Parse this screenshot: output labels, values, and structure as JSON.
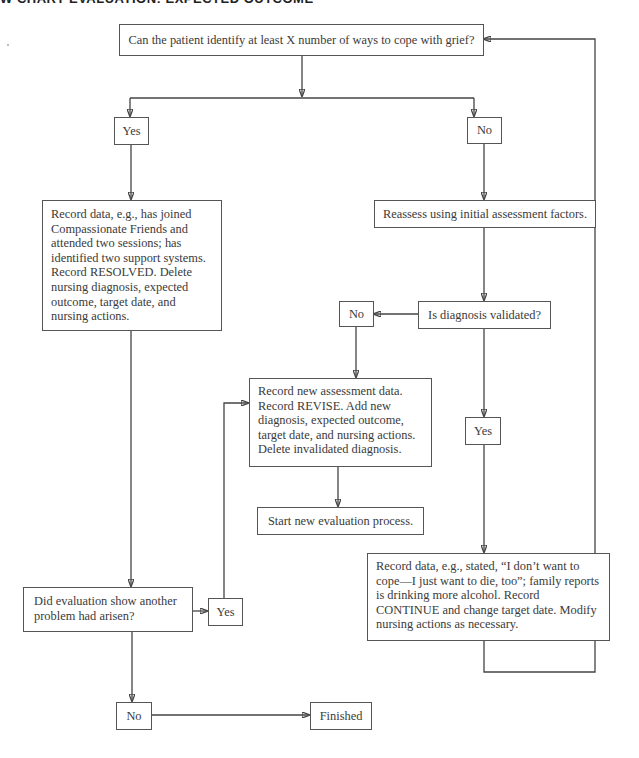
{
  "header": {
    "title": "W CHART EVALUATION: EXPECTED OUTCOME"
  },
  "nodes": {
    "start_question": "Can the patient identify at least X number of ways to cope with grief?",
    "yes_top": "Yes",
    "no_top": "No",
    "resolved_record": "Record data, e.g., has joined Compassionate Friends and attended two sessions; has identified two support systems. Record RESOLVED. Delete nursing diagnosis, expected outcome, target date, and nursing actions.",
    "reassess": "Reassess using initial assessment factors.",
    "diagnosis_validated": "Is diagnosis validated?",
    "no_validated": "No",
    "revise_record": "Record new assessment data. Record REVISE. Add new diagnosis, expected outcome, target date, and nursing actions. Delete invalidated diagnosis.",
    "start_new": "Start new evaluation process.",
    "yes_validated": "Yes",
    "continue_record": "Record data, e.g., stated, “I don’t want to cope—I just want to die, too”; family reports is drinking more alcohol. Record CONTINUE and change target date. Modify nursing actions as necessary.",
    "another_problem": "Did evaluation show another problem had arisen?",
    "yes_problem": "Yes",
    "no_problem": "No",
    "finished": "Finished"
  },
  "colors": {
    "line": "#444444",
    "border": "#555555",
    "text": "#3a3a3a"
  }
}
